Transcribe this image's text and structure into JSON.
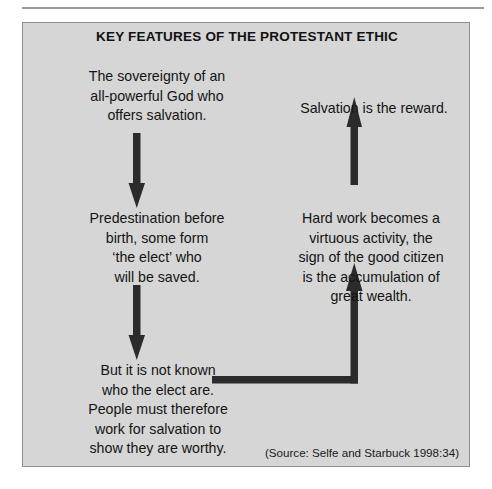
{
  "figure": {
    "title": "KEY FEATURES OF THE PROTESTANT ETHIC",
    "source": "(Source: Selfe and Starbuck 1998:34)",
    "background_color": "#d6d6d6",
    "border_color": "#8e8e8e",
    "text_color": "#141414",
    "arrow_color": "#2b2b2b"
  },
  "diagram": {
    "type": "cycle-flow",
    "nodes": [
      {
        "id": "sovereignty",
        "column": "left",
        "order": 1,
        "text": "The sovereignty of an\nall-powerful God who\noffers salvation."
      },
      {
        "id": "predestination",
        "column": "left",
        "order": 2,
        "text": "Predestination before\nbirth, some form\n‘the elect’ who\nwill be saved."
      },
      {
        "id": "not-known",
        "column": "left",
        "order": 3,
        "text": "But it is not known\nwho the elect are.\nPeople must therefore\nwork for salvation to\nshow they are worthy."
      },
      {
        "id": "hard-work",
        "column": "right",
        "order": 4,
        "text": "Hard work becomes a\nvirtuous activity, the\nsign of the good citizen\nis the accumulation of\ngreat wealth."
      },
      {
        "id": "salvation-reward",
        "column": "right",
        "order": 5,
        "text": "Salvation is the reward."
      }
    ],
    "connectors": [
      {
        "id": "arrow-1",
        "from": "sovereignty",
        "to": "predestination",
        "direction": "down",
        "shape": "straight"
      },
      {
        "id": "arrow-2",
        "from": "predestination",
        "to": "not-known",
        "direction": "down",
        "shape": "straight"
      },
      {
        "id": "arrow-3",
        "from": "not-known",
        "to": "hard-work",
        "direction": "right-then-up",
        "shape": "elbow"
      },
      {
        "id": "arrow-4",
        "from": "hard-work",
        "to": "salvation-reward",
        "direction": "up",
        "shape": "straight"
      }
    ]
  }
}
